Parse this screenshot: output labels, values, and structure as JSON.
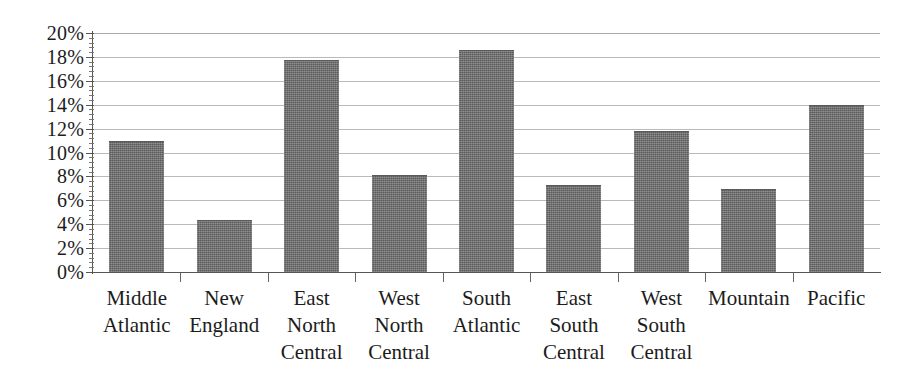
{
  "chart_data": {
    "type": "bar",
    "title": "",
    "xlabel": "",
    "ylabel": "",
    "categories": [
      "Middle Atlantic",
      "New England",
      "East North Central",
      "West North Central",
      "South Atlantic",
      "East South Central",
      "West South Central",
      "Mountain",
      "Pacific"
    ],
    "category_lines": [
      [
        "Middle",
        "Atlantic"
      ],
      [
        "New",
        "England"
      ],
      [
        "East",
        "North",
        "Central"
      ],
      [
        "West",
        "North",
        "Central"
      ],
      [
        "South",
        "Atlantic"
      ],
      [
        "East",
        "South",
        "Central"
      ],
      [
        "West",
        "South",
        "Central"
      ],
      [
        "Mountain"
      ],
      [
        "Pacific"
      ]
    ],
    "values": [
      10.9,
      4.3,
      17.7,
      8.0,
      18.5,
      7.2,
      11.7,
      6.9,
      13.9
    ],
    "value_labels": [
      "10.9%",
      "4.3%",
      "17.7%",
      "8.0%",
      "18.5%",
      "7.2%",
      "11.7%",
      "6.9%",
      "13.9%"
    ],
    "ylim": [
      0,
      20
    ],
    "ytick_step": 2,
    "ytick_values": [
      0,
      2,
      4,
      6,
      8,
      10,
      12,
      14,
      16,
      18,
      20
    ],
    "ytick_labels": [
      "0%",
      "2%",
      "4%",
      "6%",
      "8%",
      "10%",
      "12%",
      "14%",
      "16%",
      "18%",
      "20%"
    ],
    "minor_ticks_between": 4,
    "grid": true,
    "grid_axis": "y",
    "legend": false,
    "legend_position": "none",
    "series_color": "#6e6e6e",
    "grid_color": "#b9b9b9",
    "axis_color": "#555555",
    "text_color": "#1c1c1c",
    "background_color": "#ffffff"
  }
}
